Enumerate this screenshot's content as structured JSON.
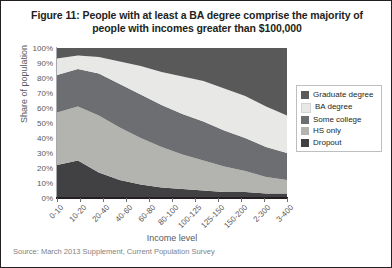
{
  "figure": {
    "title": "Figure 11: People with at least a BA degree comprise the majority of people with incomes greater than $100,000",
    "source": "Source: March 2013 Supplement, Current Population Survey"
  },
  "legend": {
    "position": "right",
    "items": [
      {
        "label": "Graduate degree",
        "color": "#595959"
      },
      {
        "label": "BA degree",
        "color": "#e8e8e6"
      },
      {
        "label": "Some college",
        "color": "#6d6e71"
      },
      {
        "label": "HS only",
        "color": "#b3b3b0"
      },
      {
        "label": "Dropout",
        "color": "#414042"
      }
    ]
  },
  "chart_data": {
    "type": "area",
    "title": "Figure 11: People with at least a BA degree comprise the majority of people with incomes greater than $100,000",
    "xlabel": "Income level",
    "ylabel": "Share of population",
    "ylim": [
      0,
      100
    ],
    "ytick_labels": [
      "100%",
      "90%",
      "80%",
      "70%",
      "60%",
      "50%",
      "40%",
      "30%",
      "20%",
      "10%",
      "0%"
    ],
    "ytick_values": [
      100,
      90,
      80,
      70,
      60,
      50,
      40,
      30,
      20,
      10,
      0
    ],
    "grid": false,
    "stacked": true,
    "stack_order_bottom_to_top": [
      "Dropout",
      "HS only",
      "Some college",
      "BA degree",
      "Graduate degree"
    ],
    "categories": [
      "0-10",
      "10-20",
      "20-40",
      "40-60",
      "60-80",
      "80-100",
      "100-125",
      "125-150",
      "150-200",
      "2-300",
      "3-400",
      "gt400"
    ],
    "x_tick_count": 11,
    "series": [
      {
        "name": "Dropout",
        "color": "#414042",
        "values": [
          22,
          25,
          17,
          12,
          9,
          7,
          6,
          5,
          4,
          4,
          3,
          3
        ]
      },
      {
        "name": "HS only",
        "color": "#b3b3b0",
        "values": [
          35,
          36,
          38,
          35,
          31,
          27,
          23,
          20,
          17,
          14,
          11,
          9
        ]
      },
      {
        "name": "Some college",
        "color": "#6d6e71",
        "values": [
          25,
          25,
          28,
          29,
          29,
          28,
          27,
          26,
          24,
          22,
          20,
          18
        ]
      },
      {
        "name": "BA degree",
        "color": "#e8e8e6",
        "values": [
          11,
          9,
          11,
          15,
          19,
          22,
          25,
          27,
          28,
          28,
          27,
          25
        ]
      },
      {
        "name": "Graduate degree",
        "color": "#595959",
        "values": [
          7,
          5,
          6,
          9,
          12,
          16,
          19,
          22,
          27,
          32,
          39,
          45
        ]
      }
    ]
  }
}
